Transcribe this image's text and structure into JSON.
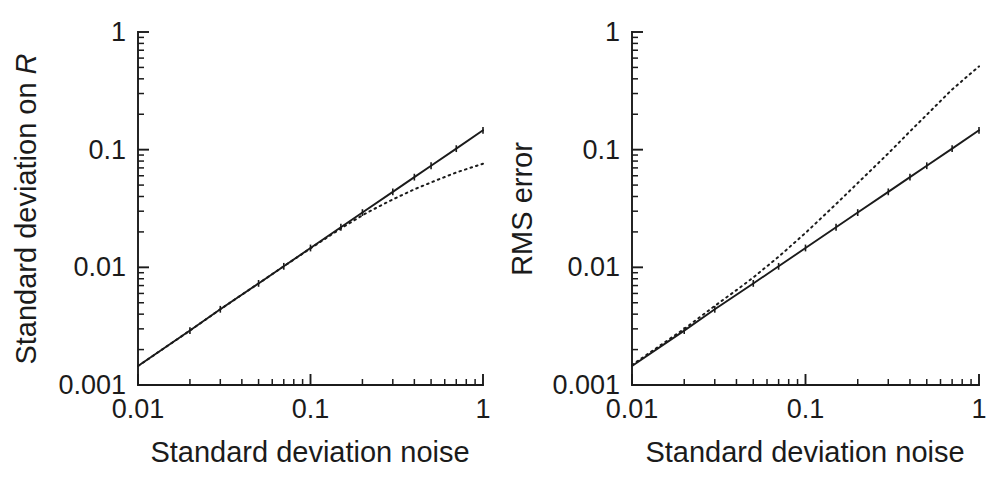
{
  "figure": {
    "background": "#ffffff",
    "ink_color": "#1b1b1b",
    "panel_count": 2
  },
  "chart_data": [
    {
      "panel_id": "left",
      "type": "line",
      "title": "",
      "xlabel": "Standard deviation noise",
      "ylabel": "Standard deviation on R",
      "ylabel_italic_tail": "R",
      "xscale": "log",
      "yscale": "log",
      "xlim": [
        0.01,
        1
      ],
      "ylim": [
        0.001,
        1
      ],
      "xticks": [
        0.01,
        0.1,
        1
      ],
      "xticklabels": [
        "0.01",
        "0.1",
        "1"
      ],
      "yticks": [
        0.001,
        0.01,
        0.1,
        1
      ],
      "yticklabels": [
        "0.001",
        "0.01",
        "0.1",
        "1"
      ],
      "grid": false,
      "legend": "none",
      "series": [
        {
          "name": "solid-curve",
          "style": "solid",
          "marker": "tick",
          "x": [
            0.01,
            0.02,
            0.03,
            0.05,
            0.07,
            0.1,
            0.15,
            0.2,
            0.3,
            0.4,
            0.5,
            0.7,
            1.0
          ],
          "y": [
            0.00145,
            0.0029,
            0.0044,
            0.0073,
            0.0102,
            0.0146,
            0.0219,
            0.0292,
            0.0438,
            0.0584,
            0.073,
            0.102,
            0.146
          ]
        },
        {
          "name": "dotted-curve",
          "style": "dotted",
          "marker": "none",
          "x": [
            0.01,
            0.02,
            0.03,
            0.05,
            0.07,
            0.1,
            0.15,
            0.2,
            0.25,
            0.3,
            0.4,
            0.5,
            0.7,
            1.0
          ],
          "y": [
            0.00145,
            0.0029,
            0.0044,
            0.0073,
            0.0102,
            0.0145,
            0.0214,
            0.0277,
            0.033,
            0.0378,
            0.046,
            0.0527,
            0.064,
            0.076
          ]
        }
      ]
    },
    {
      "panel_id": "right",
      "type": "line",
      "title": "",
      "xlabel": "Standard deviation noise",
      "ylabel": "RMS error",
      "xscale": "log",
      "yscale": "log",
      "xlim": [
        0.01,
        1
      ],
      "ylim": [
        0.001,
        1
      ],
      "xticks": [
        0.01,
        0.1,
        1
      ],
      "xticklabels": [
        "0.01",
        "0.1",
        "1"
      ],
      "yticks": [
        0.001,
        0.01,
        0.1,
        1
      ],
      "yticklabels": [
        "0.001",
        "0.01",
        "0.1",
        "1"
      ],
      "grid": false,
      "legend": "none",
      "series": [
        {
          "name": "solid-curve",
          "style": "solid",
          "marker": "tick",
          "x": [
            0.01,
            0.02,
            0.03,
            0.05,
            0.07,
            0.1,
            0.15,
            0.2,
            0.3,
            0.4,
            0.5,
            0.7,
            1.0
          ],
          "y": [
            0.00145,
            0.0029,
            0.0044,
            0.0073,
            0.0102,
            0.0146,
            0.0219,
            0.0292,
            0.0438,
            0.0584,
            0.073,
            0.102,
            0.146
          ]
        },
        {
          "name": "dotted-curve",
          "style": "dotted",
          "marker": "none",
          "x": [
            0.01,
            0.02,
            0.03,
            0.04,
            0.05,
            0.07,
            0.1,
            0.15,
            0.2,
            0.3,
            0.4,
            0.5,
            0.7,
            1.0
          ],
          "y": [
            0.00148,
            0.003,
            0.0047,
            0.0064,
            0.0082,
            0.0123,
            0.0196,
            0.0345,
            0.052,
            0.093,
            0.143,
            0.198,
            0.325,
            0.51
          ]
        }
      ]
    }
  ],
  "panels": {
    "left": {
      "y_axis_label": "Standard deviation on ",
      "y_axis_label_italic": "R",
      "x_axis_label": "Standard deviation noise",
      "x_tick_labels": [
        "0.01",
        "0.1",
        "1"
      ],
      "y_tick_labels": [
        "1",
        "0.1",
        "0.01",
        "0.001"
      ]
    },
    "right": {
      "y_axis_label": "RMS error",
      "y_axis_label_italic": "",
      "x_axis_label": "Standard deviation noise",
      "x_tick_labels": [
        "0.01",
        "0.1",
        "1"
      ],
      "y_tick_labels": [
        "1",
        "0.1",
        "0.01",
        "0.001"
      ]
    }
  }
}
